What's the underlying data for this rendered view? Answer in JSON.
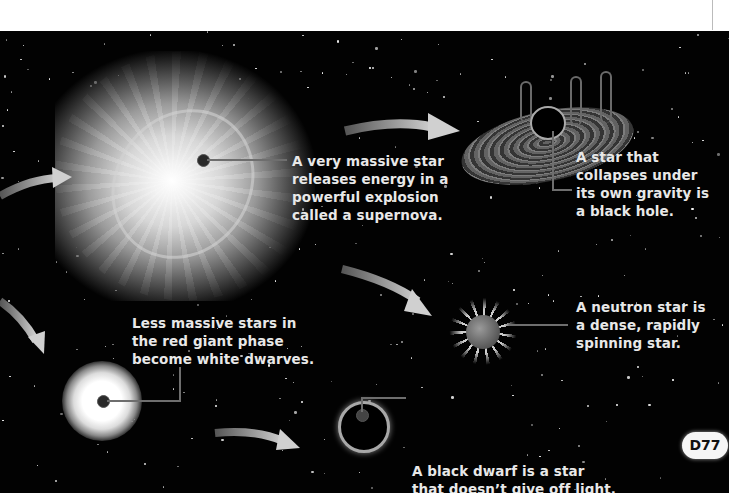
{
  "page": {
    "background_color": "#020202",
    "text_color": "#e8e8e8",
    "page_number": "D77"
  },
  "captions": {
    "supernova": [
      "A very massive star",
      "releases energy in a",
      "powerful explosion",
      "called a supernova."
    ],
    "black_hole": [
      "A star that",
      "collapses under",
      "its own gravity is",
      "a black hole."
    ],
    "white_dwarf": [
      "Less massive stars in",
      "the red giant phase",
      "become white dwarves."
    ],
    "neutron_star": [
      "A neutron star is",
      "a dense, rapidly",
      "spinning star."
    ],
    "black_dwarf": [
      "A black dwarf is a star",
      "that doesn’t give off light."
    ]
  },
  "illustrations": {
    "supernova": "supernova-illustration",
    "black_hole": "black-hole-illustration",
    "white_dwarf": "white-dwarf-illustration",
    "neutron_star": "neutron-star-illustration",
    "black_dwarf": "black-dwarf-illustration"
  }
}
